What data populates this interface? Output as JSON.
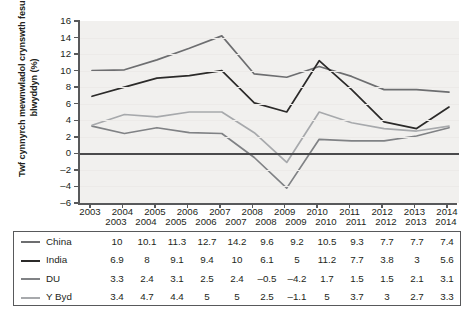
{
  "chart_data": {
    "type": "line",
    "title": "",
    "xlabel": "",
    "ylabel": "Twf cynnyrch mewnwladol crynswth fesul blwyddyn (%)",
    "categories": [
      "2003",
      "2004",
      "2005",
      "2006",
      "2007",
      "2008",
      "2009",
      "2010",
      "2011",
      "2012",
      "2013",
      "2014"
    ],
    "ylim": [
      -6,
      16
    ],
    "ytick_step": 2,
    "yticks": [
      "16",
      "14",
      "12",
      "10",
      "8",
      "6",
      "4",
      "2",
      "0",
      "–2",
      "–4",
      "–6"
    ],
    "grid": false,
    "zero_line": true,
    "legend_position": "table-below",
    "series": [
      {
        "name": "China",
        "color": "#6d6e70",
        "values": [
          10,
          10.1,
          11.3,
          12.7,
          14.2,
          9.6,
          9.2,
          10.5,
          9.3,
          7.7,
          7.7,
          7.4
        ],
        "labels": [
          "10",
          "10.1",
          "11.3",
          "12.7",
          "14.2",
          "9.6",
          "9.2",
          "10.5",
          "9.3",
          "7.7",
          "7.7",
          "7.4"
        ]
      },
      {
        "name": "India",
        "color": "#2b2a29",
        "values": [
          6.9,
          8,
          9.1,
          9.4,
          10,
          6.1,
          5,
          11.2,
          7.7,
          3.8,
          3,
          5.6
        ],
        "labels": [
          "6.9",
          "8",
          "9.1",
          "9.4",
          "10",
          "6.1",
          "5",
          "11.2",
          "7.7",
          "3.8",
          "3",
          "5.6"
        ]
      },
      {
        "name": "DU",
        "color": "#808285",
        "values": [
          3.3,
          2.4,
          3.1,
          2.5,
          2.4,
          -0.5,
          -4.2,
          1.7,
          1.5,
          1.5,
          2.1,
          3.1
        ],
        "labels": [
          "3.3",
          "2.4",
          "3.1",
          "2.5",
          "2.4",
          "–0.5",
          "–4.2",
          "1.7",
          "1.5",
          "1.5",
          "2.1",
          "3.1"
        ]
      },
      {
        "name": "Y Byd",
        "color": "#a7a9ac",
        "values": [
          3.4,
          4.7,
          4.4,
          5,
          5,
          2.5,
          -1.1,
          5,
          3.7,
          3,
          2.7,
          3.3
        ],
        "labels": [
          "3.4",
          "4.7",
          "4.4",
          "5",
          "5",
          "2.5",
          "–1.1",
          "5",
          "3.7",
          "3",
          "2.7",
          "3.3"
        ]
      }
    ]
  },
  "table": {
    "header_row": [
      "2003",
      "2004",
      "2005",
      "2006",
      "2007",
      "2008",
      "2009",
      "2010",
      "2011",
      "2012",
      "2013",
      "2014"
    ],
    "rows": [
      {
        "name": "China",
        "values": [
          "10",
          "10.1",
          "11.3",
          "12.7",
          "14.2",
          "9.6",
          "9.2",
          "10.5",
          "9.3",
          "7.7",
          "7.7",
          "7.4"
        ]
      },
      {
        "name": "India",
        "values": [
          "6.9",
          "8",
          "9.1",
          "9.4",
          "10",
          "6.1",
          "5",
          "11.2",
          "7.7",
          "3.8",
          "3",
          "5.6"
        ]
      },
      {
        "name": "DU",
        "values": [
          "3.3",
          "2.4",
          "3.1",
          "2.5",
          "2.4",
          "–0.5",
          "–4.2",
          "1.7",
          "1.5",
          "1.5",
          "2.1",
          "3.1"
        ]
      },
      {
        "name": "Y Byd",
        "values": [
          "3.4",
          "4.7",
          "4.4",
          "5",
          "5",
          "2.5",
          "–1.1",
          "5",
          "3.7",
          "3",
          "2.7",
          "3.3"
        ]
      }
    ]
  }
}
